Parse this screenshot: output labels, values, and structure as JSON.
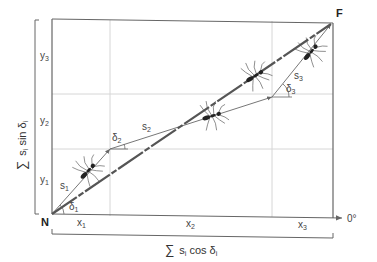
{
  "diagram": {
    "start_label": "N",
    "end_label": "F",
    "direction_label": "0°",
    "x_axis_label": {
      "sigma": "∑",
      "text": "s",
      "sub": "i",
      "rest": " cos δ",
      "sub2": "i"
    },
    "y_axis_label": {
      "sigma": "∑",
      "text": "s",
      "sub": "i",
      "rest": " sin δ",
      "sub2": "i"
    },
    "segments": [
      {
        "name": "s",
        "index": "1",
        "angle": "δ",
        "angle_index": "1",
        "x": "x",
        "x_index": "1",
        "y": "y",
        "y_index": "1"
      },
      {
        "name": "s",
        "index": "2",
        "angle": "δ",
        "angle_index": "2",
        "x": "x",
        "x_index": "2",
        "y": "y",
        "y_index": "2"
      },
      {
        "name": "s",
        "index": "3",
        "angle": "δ",
        "angle_index": "3",
        "x": "x",
        "x_index": "3",
        "y": "y",
        "y_index": "3"
      }
    ],
    "colors": {
      "frame": "#666666",
      "grid": "#d0d0d0",
      "path": "#777777",
      "direct": "#555555",
      "ant": "#222222"
    }
  }
}
